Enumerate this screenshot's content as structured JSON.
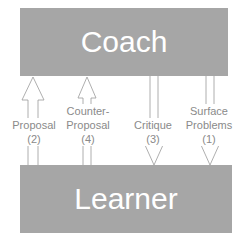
{
  "diagram": {
    "nodes": {
      "coach": {
        "label": "Coach"
      },
      "learner": {
        "label": "Learner"
      }
    },
    "edges": [
      {
        "id": "proposal",
        "line1": "Proposal",
        "line2": "(2)",
        "direction": "up",
        "from": "Learner",
        "to": "Coach"
      },
      {
        "id": "counter-proposal",
        "line1": "Counter-",
        "line2": "Proposal",
        "line3": "(4)",
        "direction": "up",
        "from": "Learner",
        "to": "Coach"
      },
      {
        "id": "critique",
        "line1": "Critique",
        "line2": "(3)",
        "direction": "down",
        "from": "Coach",
        "to": "Learner"
      },
      {
        "id": "surface-problems",
        "line1": "Surface",
        "line2": "Problems",
        "line3": "(1)",
        "direction": "down",
        "from": "Coach",
        "to": "Learner"
      }
    ]
  },
  "colors": {
    "box_fill": "#a6a6a6",
    "box_text": "#ffffff",
    "arrow_stroke": "#9a9a9a",
    "label_text": "#8a8a8a"
  }
}
